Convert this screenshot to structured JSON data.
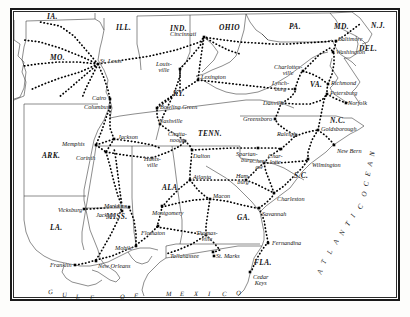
{
  "map": {
    "title": "Railroad map of the Southern United States, Civil War era",
    "frame_color": "#1a1a1a",
    "background_color": "#ffffff",
    "ink_color": "#111111",
    "states": [
      {
        "name": "IA.",
        "x": 47,
        "y": 13
      },
      {
        "name": "ILL.",
        "x": 116,
        "y": 24
      },
      {
        "name": "IND.",
        "x": 170,
        "y": 25
      },
      {
        "name": "OHIO",
        "x": 219,
        "y": 24
      },
      {
        "name": "PA.",
        "x": 289,
        "y": 23
      },
      {
        "name": "MD.",
        "x": 334,
        "y": 23
      },
      {
        "name": "N.J.",
        "x": 371,
        "y": 22
      },
      {
        "name": "DEL.",
        "x": 359,
        "y": 45
      },
      {
        "name": "MO.",
        "x": 50,
        "y": 54
      },
      {
        "name": "KY.",
        "x": 173,
        "y": 90
      },
      {
        "name": "VA.",
        "x": 310,
        "y": 81
      },
      {
        "name": "N.C.",
        "x": 330,
        "y": 117
      },
      {
        "name": "TENN.",
        "x": 198,
        "y": 130
      },
      {
        "name": "ARK.",
        "x": 42,
        "y": 152
      },
      {
        "name": "S.C.",
        "x": 294,
        "y": 172
      },
      {
        "name": "ALA.",
        "x": 162,
        "y": 184
      },
      {
        "name": "GA.",
        "x": 237,
        "y": 214
      },
      {
        "name": "MISS.",
        "x": 106,
        "y": 213
      },
      {
        "name": "LA.",
        "x": 50,
        "y": 224
      },
      {
        "name": "FLA.",
        "x": 254,
        "y": 259
      }
    ],
    "cities": [
      {
        "name": "St. Louis",
        "lx": 100,
        "ly": 58,
        "dx": 98,
        "dy": 64,
        "lines": 1
      },
      {
        "name": "Cincinnati",
        "lx": 170,
        "ly": 31,
        "dx": 204,
        "dy": 37,
        "lines": 1
      },
      {
        "name": "Louis-|ville",
        "lx": 156,
        "ly": 61,
        "dx": 180,
        "dy": 69,
        "lines": 2
      },
      {
        "name": "Lexington",
        "lx": 201,
        "ly": 74,
        "dx": 198,
        "dy": 80,
        "lines": 1
      },
      {
        "name": "Cairo",
        "lx": 92,
        "ly": 95,
        "dx": 110,
        "dy": 99,
        "lines": 1
      },
      {
        "name": "Columbus",
        "lx": 84,
        "ly": 104,
        "dx": 110,
        "dy": 107,
        "lines": 1
      },
      {
        "name": "Bowling Green",
        "lx": 160,
        "ly": 104,
        "dx": 157,
        "dy": 108,
        "lines": 1
      },
      {
        "name": "Nashville",
        "lx": 159,
        "ly": 118,
        "dx": 160,
        "dy": 124,
        "lines": 1
      },
      {
        "name": "Chatta-|nooga",
        "lx": 168,
        "ly": 131,
        "dx": 185,
        "dy": 141,
        "lines": 2
      },
      {
        "name": "Memphis",
        "lx": 62,
        "ly": 141,
        "dx": 96,
        "dy": 145,
        "lines": 1
      },
      {
        "name": "Jackson",
        "lx": 118,
        "ly": 134,
        "dx": 114,
        "dy": 139,
        "lines": 1
      },
      {
        "name": "Corinth",
        "lx": 76,
        "ly": 155,
        "dx": 106,
        "dy": 152,
        "lines": 1
      },
      {
        "name": "Hunts-|ville",
        "lx": 144,
        "ly": 156,
        "dx": 152,
        "dy": 158,
        "lines": 2
      },
      {
        "name": "Dalton",
        "lx": 193,
        "ly": 153,
        "dx": 192,
        "dy": 150,
        "lines": 1
      },
      {
        "name": "Spartan-|burg",
        "lx": 236,
        "ly": 151,
        "dx": 258,
        "dy": 148,
        "lines": 2
      },
      {
        "name": "Char-|lotte",
        "lx": 268,
        "ly": 153,
        "dx": 281,
        "dy": 149,
        "lines": 2
      },
      {
        "name": "Atlanta",
        "lx": 193,
        "ly": 174,
        "dx": 190,
        "dy": 180,
        "lines": 1
      },
      {
        "name": "Ham-|burg",
        "lx": 236,
        "ly": 173,
        "dx": 246,
        "dy": 180,
        "lines": 2
      },
      {
        "name": "Macon",
        "lx": 213,
        "ly": 193,
        "dx": 210,
        "dy": 199,
        "lines": 1
      },
      {
        "name": "Montgomery",
        "lx": 152,
        "ly": 210,
        "dx": 162,
        "dy": 206,
        "lines": 1
      },
      {
        "name": "Flomaton",
        "lx": 141,
        "ly": 230,
        "dx": 158,
        "dy": 226,
        "lines": 1
      },
      {
        "name": "Thomas-|ville",
        "lx": 196,
        "ly": 230,
        "dx": 206,
        "dy": 235,
        "lines": 2
      },
      {
        "name": "Tallahassee",
        "lx": 170,
        "ly": 253,
        "dx": 213,
        "dy": 252,
        "lines": 1
      },
      {
        "name": "St. Marks",
        "lx": 216,
        "ly": 253,
        "dx": 214,
        "dy": 256,
        "lines": 1
      },
      {
        "name": "Cedar|Keys",
        "lx": 253,
        "ly": 274,
        "dx": 250,
        "dy": 272,
        "lines": 2
      },
      {
        "name": "Fernandina",
        "lx": 272,
        "ly": 240,
        "dx": 268,
        "dy": 243,
        "lines": 1
      },
      {
        "name": "Savannah",
        "lx": 262,
        "ly": 211,
        "dx": 259,
        "dy": 208,
        "lines": 1
      },
      {
        "name": "Charleston",
        "lx": 277,
        "ly": 196,
        "dx": 274,
        "dy": 193,
        "lines": 1
      },
      {
        "name": "Wilmington",
        "lx": 312,
        "ly": 162,
        "dx": 308,
        "dy": 159,
        "lines": 1
      },
      {
        "name": "New Bern",
        "lx": 337,
        "ly": 148,
        "dx": 334,
        "dy": 145,
        "lines": 1
      },
      {
        "name": "Goldsborough",
        "lx": 321,
        "ly": 126,
        "dx": 318,
        "dy": 130,
        "lines": 1
      },
      {
        "name": "Raleigh",
        "lx": 277,
        "ly": 131,
        "dx": 296,
        "dy": 135,
        "lines": 1
      },
      {
        "name": "Cher-|aw",
        "lx": 252,
        "ly": 158,
        "dx": 264,
        "dy": 163,
        "lines": 2
      },
      {
        "name": "Greensboro",
        "lx": 243,
        "ly": 116,
        "dx": 275,
        "dy": 119,
        "lines": 1
      },
      {
        "name": "Danville",
        "lx": 263,
        "ly": 100,
        "dx": 282,
        "dy": 103,
        "lines": 1
      },
      {
        "name": "Lynch-|burg",
        "lx": 272,
        "ly": 80,
        "dx": 295,
        "dy": 89,
        "lines": 2
      },
      {
        "name": "Charlottes-|ville",
        "lx": 274,
        "ly": 64,
        "dx": 303,
        "dy": 71,
        "lines": 2
      },
      {
        "name": "Richmond",
        "lx": 331,
        "ly": 80,
        "dx": 328,
        "dy": 84,
        "lines": 1
      },
      {
        "name": "Petersburg",
        "lx": 330,
        "ly": 90,
        "dx": 327,
        "dy": 94,
        "lines": 1
      },
      {
        "name": "Norfolk",
        "lx": 348,
        "ly": 100,
        "dx": 346,
        "dy": 103,
        "lines": 1
      },
      {
        "name": "Baltimore",
        "lx": 338,
        "ly": 36,
        "dx": 336,
        "dy": 41,
        "lines": 1
      },
      {
        "name": "Washington",
        "lx": 336,
        "ly": 49,
        "dx": 333,
        "dy": 52,
        "lines": 1
      },
      {
        "name": "Meridian",
        "lx": 104,
        "ly": 203,
        "dx": 129,
        "dy": 207,
        "lines": 1
      },
      {
        "name": "Jackson",
        "lx": 96,
        "ly": 212,
        "dx": 122,
        "dy": 211,
        "lines": 1
      },
      {
        "name": "Vicksburg",
        "lx": 58,
        "ly": 207,
        "dx": 84,
        "dy": 209,
        "lines": 1
      },
      {
        "name": "Mobile",
        "lx": 115,
        "ly": 245,
        "dx": 136,
        "dy": 246,
        "lines": 1
      },
      {
        "name": "New Orleans",
        "lx": 98,
        "ly": 263,
        "dx": 96,
        "dy": 261,
        "lines": 1
      },
      {
        "name": "Franklin",
        "lx": 50,
        "ly": 262,
        "dx": 75,
        "dy": 265,
        "lines": 1
      }
    ],
    "ocean_labels": [
      {
        "text": "GULF  OF  MEXICO",
        "letters": [
          "G",
          "U",
          "L",
          "F",
          "O",
          "F",
          "M",
          "E",
          "X",
          "I",
          "C",
          "O"
        ]
      },
      {
        "text": "ATLANTIC OCEAN",
        "letters": [
          "A",
          "T",
          "L",
          "A",
          "N",
          "T",
          "I",
          "C",
          "O",
          "C",
          "E",
          "A",
          "N"
        ]
      }
    ],
    "legend_note": ""
  }
}
